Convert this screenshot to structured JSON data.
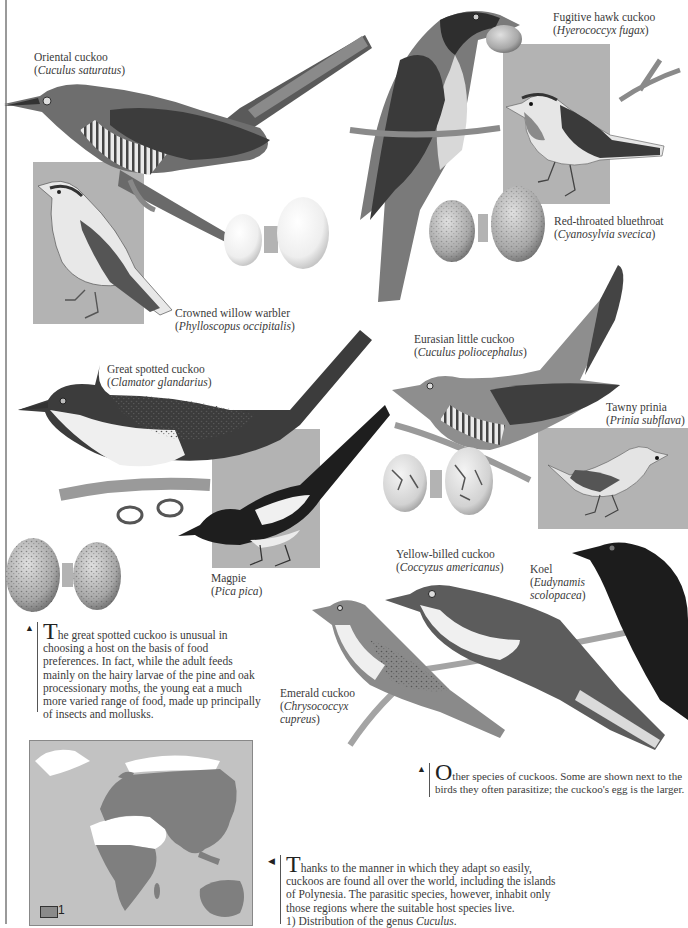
{
  "species_labels": [
    {
      "id": "oriental-cuckoo",
      "common": "Oriental cuckoo",
      "scientific": "Cuculus saturatus"
    },
    {
      "id": "fugitive-hawk-cuckoo",
      "common": "Fugitive hawk cuckoo",
      "scientific": "Hyerococcyx fugax"
    },
    {
      "id": "red-throated-bluethroat",
      "common": "Red-throated bluethroat",
      "scientific": "Cyanosylvia svecica"
    },
    {
      "id": "crowned-willow-warbler",
      "common": "Crowned willow warbler",
      "scientific": "Phylloscopus occipitalis"
    },
    {
      "id": "eurasian-little-cuckoo",
      "common": "Eurasian little cuckoo",
      "scientific": "Cuculus poliocephalus"
    },
    {
      "id": "great-spotted-cuckoo",
      "common": "Great spotted cuckoo",
      "scientific": "Clamator glandarius"
    },
    {
      "id": "tawny-prinia",
      "common": "Tawny prinia",
      "scientific": "Prinia subflava"
    },
    {
      "id": "magpie",
      "common": "Magpie",
      "scientific": "Pica pica"
    },
    {
      "id": "yellow-billed-cuckoo",
      "common": "Yellow-billed cuckoo",
      "scientific": "Coccyzus americanus"
    },
    {
      "id": "koel",
      "common": "Koel",
      "scientific_line1": "Eudynamis",
      "scientific_line2": "scolopacea"
    },
    {
      "id": "emerald-cuckoo",
      "common": "Emerald cuckoo",
      "scientific_line1": "Chrysococcyx",
      "scientific_line2": "cupreus"
    }
  ],
  "captions": {
    "great_spotted": {
      "arrow": "▲",
      "dropcap": "T",
      "lines": [
        "he great spotted cuckoo is unusual in",
        "choosing a host on the basis of food",
        "preferences. In fact, while the adult feeds",
        "mainly on the hairy larvae of the pine and oak",
        "processionary moths, the young eat a much",
        "more varied range of food, made up principally",
        "of insects and mollusks."
      ]
    },
    "other_species": {
      "arrow": "▲",
      "dropcap": "O",
      "lines": [
        "ther species of cuckoos. Some are shown next to the",
        "birds they often parasitize; the cuckoo's egg is the larger."
      ]
    },
    "distribution": {
      "arrow": "◀",
      "dropcap": "T",
      "lines": [
        "hanks to the manner in which they adapt so easily,",
        "cuckoos are found all over the world, including the islands",
        "of Polynesia. The parasitic species, however, inhabit only",
        "those regions where the suitable host species live."
      ],
      "footnote_prefix": "1) Distribution of the genus ",
      "footnote_genus": "Cuculus",
      "footnote_suffix": "."
    }
  },
  "map": {
    "legend_number": "1",
    "legend_meaning": "Distribution of the genus Cuculus"
  },
  "colors": {
    "panel_gray": "#b3b3b3",
    "map_ocean": "#c2c2c2",
    "map_range": "#7f7f7f",
    "map_land_outside": "#ffffff"
  }
}
